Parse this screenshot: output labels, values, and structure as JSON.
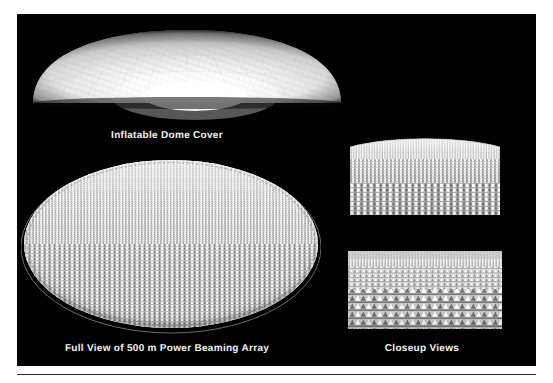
{
  "page": {
    "background_color": "#ffffff",
    "panel_color": "#010101",
    "caption_color": "#f2f2f2",
    "rule_color": "#2b2b2b"
  },
  "figure": {
    "panels": [
      {
        "id": "dome",
        "caption": "Inflatable Dome Cover",
        "icon": "dome-illustration"
      },
      {
        "id": "array",
        "caption": "Full View of 500 m Power Beaming Array",
        "icon": "array-disc-illustration"
      },
      {
        "id": "closeups",
        "caption": "Closeup Views",
        "icon": "closeup-illustration"
      }
    ]
  },
  "captions": {
    "dome": "Inflatable Dome Cover",
    "array": "Full View of 500 m Power Beaming Array",
    "closeups": "Closeup Views"
  }
}
